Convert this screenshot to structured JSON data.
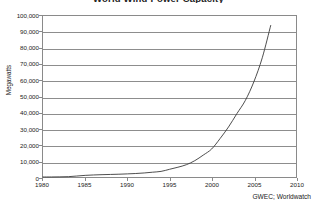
{
  "figure": {
    "title_partial": "World Wind Power Capacity",
    "source_note": "GWEC; Worldwatch"
  },
  "chart_data": {
    "type": "line",
    "title": "World Wind Power Capacity",
    "xlabel": "",
    "ylabel": "Megawatts",
    "xlim": [
      1980,
      2010
    ],
    "ylim": [
      0,
      100000
    ],
    "grid": true,
    "legend": false,
    "source": "GWEC; Worldwatch",
    "xticks": [
      1980,
      1985,
      1990,
      1995,
      2000,
      2005,
      2010
    ],
    "xtick_labels": [
      "1980",
      "1985",
      "1990",
      "1995",
      "2000",
      "2005",
      "2010"
    ],
    "yticks": [
      0,
      10000,
      20000,
      30000,
      40000,
      50000,
      60000,
      70000,
      80000,
      90000,
      100000
    ],
    "ytick_labels": [
      "0",
      "10,000",
      "20,000",
      "30,000",
      "40,000",
      "50,000",
      "60,000",
      "70,000",
      "80,000",
      "90,000",
      "100,000"
    ],
    "series": [
      {
        "name": "World Wind Power Capacity",
        "color": "#3a3a3a",
        "x": [
          1980,
          1981,
          1982,
          1983,
          1984,
          1985,
          1986,
          1987,
          1988,
          1989,
          1990,
          1991,
          1992,
          1993,
          1994,
          1995,
          1996,
          1997,
          1998,
          1999,
          2000,
          2001,
          2002,
          2003,
          2004,
          2005,
          2006,
          2007
        ],
        "values": [
          10,
          25,
          90,
          210,
          600,
          1020,
          1270,
          1450,
          1580,
          1730,
          1930,
          2170,
          2510,
          2990,
          3490,
          4780,
          6070,
          7640,
          10150,
          13600,
          17400,
          23900,
          31100,
          39430,
          47620,
          59091,
          74052,
          94112
        ]
      }
    ]
  }
}
